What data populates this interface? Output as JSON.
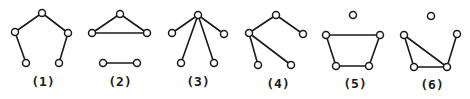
{
  "figure": {
    "stroke_color": "#1a1a1a",
    "background": "#ffffff",
    "node_radius": 3.5,
    "graphs": [
      {
        "label": "(1)",
        "label_pos": [
          43,
          86
        ],
        "nodes": [
          [
            42,
            13
          ],
          [
            15,
            32
          ],
          [
            68,
            33
          ],
          [
            26,
            63
          ],
          [
            59,
            63
          ]
        ],
        "edges": [
          [
            0,
            1
          ],
          [
            0,
            2
          ],
          [
            1,
            3
          ],
          [
            2,
            4
          ]
        ]
      },
      {
        "label": "(2)",
        "label_pos": [
          120,
          86
        ],
        "nodes": [
          [
            120,
            14
          ],
          [
            92,
            33
          ],
          [
            147,
            33
          ],
          [
            103,
            63
          ],
          [
            137,
            63
          ]
        ],
        "edges": [
          [
            0,
            1
          ],
          [
            0,
            2
          ],
          [
            1,
            2
          ],
          [
            3,
            4
          ]
        ]
      },
      {
        "label": "(3)",
        "label_pos": [
          198,
          86
        ],
        "nodes": [
          [
            198,
            15
          ],
          [
            172,
            33
          ],
          [
            224,
            34
          ],
          [
            181,
            63
          ],
          [
            214,
            63
          ]
        ],
        "edges": [
          [
            0,
            1
          ],
          [
            0,
            2
          ],
          [
            0,
            3
          ],
          [
            0,
            4
          ]
        ]
      },
      {
        "label": "(4)",
        "label_pos": [
          278,
          88
        ],
        "nodes": [
          [
            276,
            15
          ],
          [
            249,
            33
          ],
          [
            303,
            34
          ],
          [
            258,
            65
          ],
          [
            291,
            65
          ]
        ],
        "edges": [
          [
            0,
            1
          ],
          [
            0,
            2
          ],
          [
            1,
            3
          ],
          [
            1,
            4
          ]
        ]
      },
      {
        "label": "(5)",
        "label_pos": [
          355,
          88
        ],
        "nodes": [
          [
            353,
            15
          ],
          [
            326,
            35
          ],
          [
            380,
            35
          ],
          [
            336,
            66
          ],
          [
            369,
            66
          ]
        ],
        "edges": [
          [
            1,
            2
          ],
          [
            1,
            3
          ],
          [
            2,
            4
          ],
          [
            3,
            4
          ]
        ]
      },
      {
        "label": "(6)",
        "label_pos": [
          432,
          89
        ],
        "nodes": [
          [
            431,
            16
          ],
          [
            404,
            35
          ],
          [
            457,
            34
          ],
          [
            414,
            67
          ],
          [
            447,
            67
          ]
        ],
        "edges": [
          [
            1,
            3
          ],
          [
            1,
            4
          ],
          [
            3,
            4
          ],
          [
            2,
            4
          ]
        ]
      }
    ]
  }
}
